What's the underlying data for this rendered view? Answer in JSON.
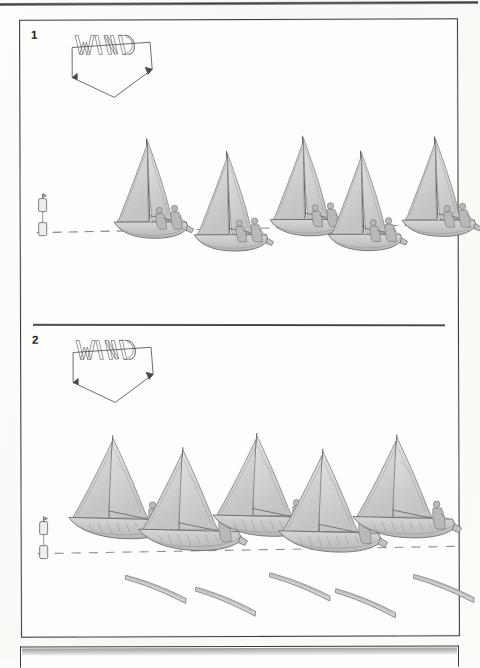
{
  "document": {
    "kind": "sailing-instruction-figure-page",
    "background_color": "#fcfcfa",
    "ink_color": "#3a3a3a",
    "sail_fill": "#d4d4d4",
    "hull_fill": "#c9c9c9",
    "crew_fill": "#b4b4b4",
    "wake_fill": "#cfcfcf"
  },
  "panels": [
    {
      "number": "1",
      "wind_label": "WIND",
      "wind_direction": "down",
      "mark": {
        "name": "committee-buoy",
        "label": ""
      },
      "layline": {
        "style": "dashed",
        "label": ""
      },
      "boat_count": 5,
      "boats": [
        {
          "id": "boat-1-1",
          "x": 92,
          "y": 118,
          "scale": 1.0,
          "crew": 2,
          "heel": "upright",
          "tack": "starboard"
        },
        {
          "id": "boat-1-2",
          "x": 170,
          "y": 130,
          "scale": 1.0,
          "crew": 2,
          "heel": "upright",
          "tack": "starboard"
        },
        {
          "id": "boat-1-3",
          "x": 248,
          "y": 116,
          "scale": 1.0,
          "crew": 2,
          "heel": "upright",
          "tack": "starboard"
        },
        {
          "id": "boat-1-4",
          "x": 312,
          "y": 131,
          "scale": 1.0,
          "crew": 2,
          "heel": "upright",
          "tack": "starboard"
        },
        {
          "id": "boat-1-5",
          "x": 386,
          "y": 117,
          "scale": 1.0,
          "crew": 2,
          "heel": "upright",
          "tack": "starboard"
        }
      ]
    },
    {
      "number": "2",
      "wind_label": "WIND",
      "wind_direction": "down",
      "mark": {
        "name": "committee-buoy",
        "label": ""
      },
      "layline": {
        "style": "dashed",
        "label": ""
      },
      "boat_count": 5,
      "boats": [
        {
          "id": "boat-2-1",
          "x": 46,
          "y": 110,
          "scale": 1.0,
          "crew": 1,
          "heel": "heeled",
          "tack": "port",
          "wake": true
        },
        {
          "id": "boat-2-2",
          "x": 116,
          "y": 118,
          "scale": 1.0,
          "crew": 1,
          "heel": "heeled",
          "tack": "port",
          "wake": true
        },
        {
          "id": "boat-2-3",
          "x": 186,
          "y": 107,
          "scale": 1.0,
          "crew": 1,
          "heel": "heeled",
          "tack": "port",
          "wake": true
        },
        {
          "id": "boat-2-4",
          "x": 258,
          "y": 121,
          "scale": 1.0,
          "crew": 1,
          "heel": "heeled",
          "tack": "port",
          "wake": true
        },
        {
          "id": "boat-2-5",
          "x": 326,
          "y": 105,
          "scale": 1.0,
          "crew": 1,
          "heel": "heeled",
          "tack": "port",
          "wake": true
        }
      ]
    }
  ],
  "next_figure": {
    "number": "3",
    "visible": "partial"
  }
}
